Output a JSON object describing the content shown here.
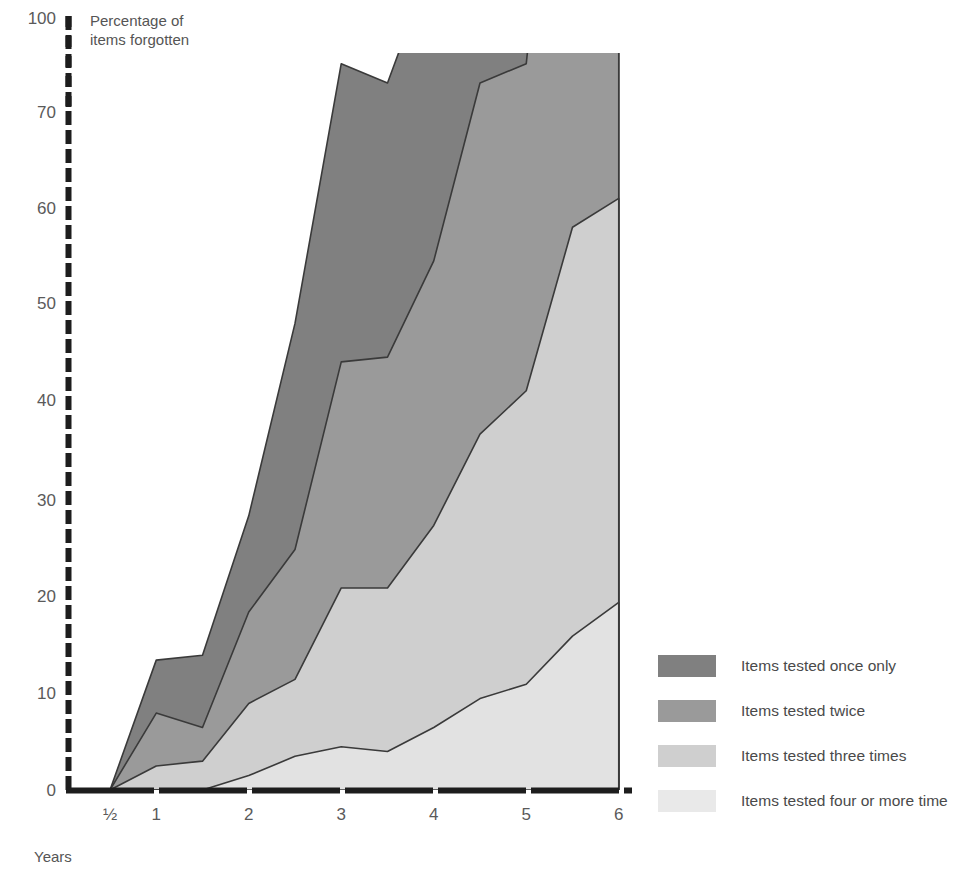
{
  "chart_data": {
    "type": "area",
    "title": "",
    "subtitle": "",
    "ylabel_line1": "Percentage of",
    "ylabel_line2": "items forgotten",
    "xlabel": "Years",
    "stacked": true,
    "grid": false,
    "legend_position": "right",
    "xlim": [
      0,
      6
    ],
    "ylim": [
      0,
      100
    ],
    "y_ticks": [
      "0",
      "10",
      "20",
      "30",
      "40",
      "50",
      "60",
      "70",
      "100"
    ],
    "y_tick_values": [
      0,
      10,
      20,
      30,
      40,
      50,
      60,
      70,
      100
    ],
    "y_axis_break_note": "axis compressed between 70 and 100",
    "x_ticks": [
      "½",
      "1",
      "2",
      "3",
      "4",
      "5",
      "6"
    ],
    "x_tick_values": [
      0.5,
      1,
      2,
      3,
      4,
      5,
      6
    ],
    "x": [
      0.5,
      1,
      1.5,
      2,
      2.5,
      3,
      3.5,
      4,
      4.5,
      5,
      5.5,
      6
    ],
    "series": [
      {
        "name": "Items tested four or more time",
        "color": "#e2e2e2",
        "values": [
          0,
          0,
          0,
          1.5,
          3.5,
          4.5,
          4,
          6.5,
          9.5,
          11,
          16,
          19.5
        ]
      },
      {
        "name": "Items tested three times",
        "color": "#cfcfcf",
        "values": [
          0,
          2.5,
          3,
          7.5,
          8,
          16.5,
          17,
          21,
          27.5,
          30.5,
          42.5,
          42
        ]
      },
      {
        "name": "Items tested twice",
        "color": "#9a9a9a",
        "values": [
          0,
          5.5,
          3.5,
          9.5,
          13.5,
          23.5,
          24,
          27.5,
          36.5,
          34,
          62.5,
          58
        ]
      },
      {
        "name": "Items tested once only",
        "color": "#808080",
        "values": [
          0,
          5.5,
          7.5,
          10,
          23.5,
          31,
          28.5,
          31.5,
          56,
          72,
          104,
          112
        ]
      }
    ],
    "legend": [
      {
        "label": "Items tested once only",
        "color": "#808080"
      },
      {
        "label": "Items tested twice",
        "color": "#9a9a9a"
      },
      {
        "label": "Items tested three times",
        "color": "#cfcfcf"
      },
      {
        "label": "Items tested four or more time",
        "color": "#e9e9e9"
      }
    ],
    "axis_color": "#1d1d1d",
    "outline_color": "#3a3a3a"
  }
}
